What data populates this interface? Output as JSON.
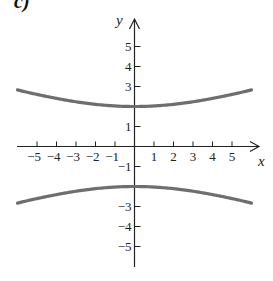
{
  "part_label": "c)",
  "colors": {
    "axis": "#222222",
    "curve": "#6e6e6e",
    "text": "#222222"
  },
  "chart_data": {
    "type": "line",
    "title": "",
    "xlabel": "x",
    "ylabel": "y",
    "xlim": [
      -6,
      6
    ],
    "ylim": [
      -6,
      6
    ],
    "grid": false,
    "x_ticks": [
      -5,
      -4,
      -3,
      -2,
      -1,
      1,
      2,
      3,
      4,
      5
    ],
    "x_tick_labels": [
      "−5",
      "−4",
      "−3",
      "−2",
      "−1",
      "1",
      "2",
      "3",
      "4",
      "5"
    ],
    "y_ticks": [
      5,
      4,
      3,
      1,
      -1,
      -3,
      -4,
      -5
    ],
    "y_tick_labels": [
      "5",
      "4",
      "3",
      "1",
      "−1",
      "−3",
      "−4",
      "−5"
    ],
    "equation": "y^2/4 - x^2/36 = 1",
    "series": [
      {
        "name": "upper branch",
        "x": [
          -6,
          -5,
          -4,
          -3,
          -2,
          -1,
          0,
          1,
          2,
          3,
          4,
          5,
          6
        ],
        "y": [
          2.83,
          2.6,
          2.4,
          2.24,
          2.11,
          2.03,
          2.0,
          2.03,
          2.11,
          2.24,
          2.4,
          2.6,
          2.83
        ]
      },
      {
        "name": "lower branch",
        "x": [
          -6,
          -5,
          -4,
          -3,
          -2,
          -1,
          0,
          1,
          2,
          3,
          4,
          5,
          6
        ],
        "y": [
          -2.83,
          -2.6,
          -2.4,
          -2.24,
          -2.11,
          -2.03,
          -2.0,
          -2.03,
          -2.11,
          -2.24,
          -2.4,
          -2.6,
          -2.83
        ]
      }
    ]
  }
}
